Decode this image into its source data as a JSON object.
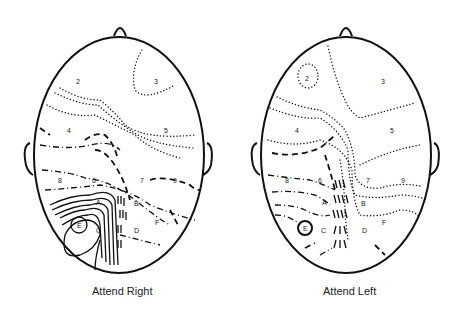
{
  "figure": {
    "panels": [
      {
        "caption": "Attend Right",
        "region_labels": [
          "2",
          "3",
          "4",
          "5",
          "8",
          "6",
          "7",
          "9",
          "A",
          "B",
          "E",
          "C",
          "D",
          "F"
        ]
      },
      {
        "caption": "Attend Left",
        "region_labels": [
          "2",
          "3",
          "4",
          "5",
          "8",
          "6",
          "7",
          "9",
          "A",
          "B",
          "E",
          "C",
          "D",
          "F"
        ]
      }
    ]
  },
  "labels": {
    "left": {
      "l2": "2",
      "l3": "3",
      "l4": "4",
      "l5": "5",
      "l8": "8",
      "l6": "6",
      "l7": "7",
      "l9": "9",
      "lA": "A",
      "lB": "B",
      "lE": "E",
      "lC": "C",
      "lD": "D",
      "lF": "F"
    },
    "right": {
      "l2": "2",
      "l3": "3",
      "l4": "4",
      "l5": "5",
      "l8": "8",
      "l6": "6",
      "l7": "7",
      "l9": "9",
      "lA": "A",
      "lB": "B",
      "lE": "E",
      "lC": "C",
      "lD": "D",
      "lF": "F"
    }
  }
}
